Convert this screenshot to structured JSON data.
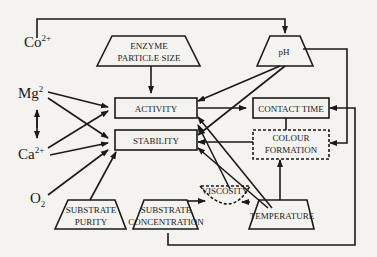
{
  "diagram": {
    "nodes": {
      "co": {
        "label": "Co",
        "sup": "2+"
      },
      "mg": {
        "label": "Mg",
        "sup": "2"
      },
      "ca": {
        "label": "Ca",
        "sup": "2+"
      },
      "o2": {
        "label": "O",
        "sub": "2"
      },
      "enzyme_size": {
        "line1": "ENZYME",
        "line2": "PARTICLE SIZE"
      },
      "ph": {
        "label": "pH"
      },
      "activity": {
        "label": "ACTIVITY"
      },
      "stability": {
        "label": "STABILITY"
      },
      "contact_time": {
        "label": "CONTACT TIME"
      },
      "colour_formation": {
        "line1": "COLOUR",
        "line2": "FORMATION"
      },
      "viscosity": {
        "label": "VISCOSITY"
      },
      "substrate_purity": {
        "line1": "SUBSTRATE",
        "line2": "PURITY"
      },
      "substrate_concentration": {
        "line1": "SUBSTRATE",
        "line2": "CONCENTRATION"
      },
      "temperature": {
        "label": "TEMPERATURE"
      }
    },
    "colors": {
      "line": "#1a1a1a",
      "background": "#f4f3ef"
    }
  }
}
